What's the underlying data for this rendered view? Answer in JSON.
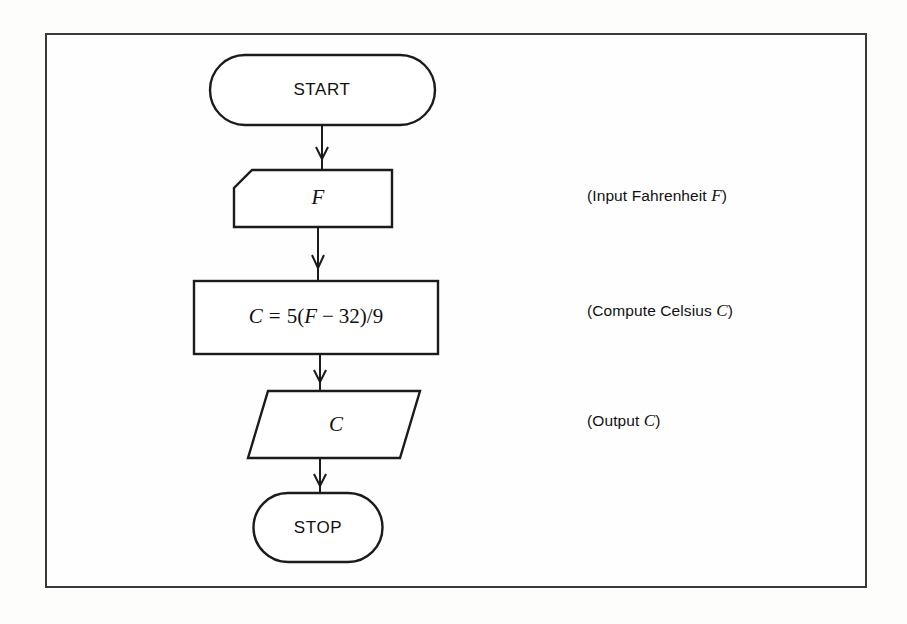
{
  "figure": {
    "type": "flowchart",
    "background_color": "#fdfdfc",
    "line_color": "#1b1b1b",
    "frame_color": "#3a3a3a"
  },
  "nodes": {
    "start": {
      "label": "START",
      "shape": "terminator-stadium"
    },
    "input": {
      "label": "F",
      "shape": "input-clipped-corner"
    },
    "process": {
      "label_full": "C = 5(F − 32)/9",
      "lhs": "C",
      "equals": "=",
      "rhs_coefficient": "5",
      "rhs_open_paren": "(",
      "rhs_var": "F",
      "rhs_minus": "−",
      "rhs_constant": "32",
      "rhs_close_paren": ")",
      "rhs_divide": "/",
      "rhs_divisor": "9",
      "shape": "process-rectangle"
    },
    "output": {
      "label": "C",
      "shape": "output-parallelogram"
    },
    "stop": {
      "label": "STOP",
      "shape": "terminator-stadium"
    }
  },
  "annotations": [
    {
      "id": "input-note",
      "prefix": "(Input Fahrenheit ",
      "variable": "F",
      "suffix": ")",
      "full_text": "(Input Fahrenheit F)"
    },
    {
      "id": "process-note",
      "prefix": "(Compute Celsius ",
      "variable": "C",
      "suffix": ")",
      "full_text": "(Compute Celsius C)"
    },
    {
      "id": "output-note",
      "prefix": "(Output ",
      "variable": "C",
      "suffix": ")",
      "full_text": "(Output C)"
    }
  ],
  "connectors": [
    {
      "id": "start-to-input",
      "from": "start",
      "to": "input",
      "arrow": "down"
    },
    {
      "id": "input-to-process",
      "from": "input",
      "to": "process",
      "arrow": "down"
    },
    {
      "id": "process-to-output",
      "from": "process",
      "to": "output",
      "arrow": "down"
    },
    {
      "id": "output-to-stop",
      "from": "output",
      "to": "stop",
      "arrow": "down"
    }
  ]
}
